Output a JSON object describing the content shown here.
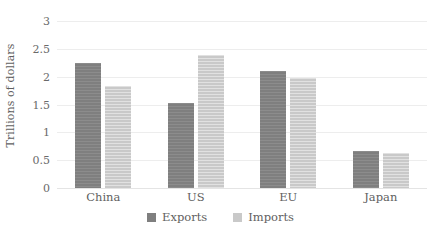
{
  "chart_data": {
    "type": "bar",
    "title": "",
    "subtitle": "",
    "xlabel": "",
    "ylabel": "Trillions of dollars",
    "categories": [
      "China",
      "US",
      "EU",
      "Japan"
    ],
    "series": [
      {
        "name": "Exports",
        "color": "#7f7f7f",
        "values": [
          2.25,
          1.53,
          2.1,
          0.66
        ]
      },
      {
        "name": "Imports",
        "color": "#c9c9c9",
        "values": [
          1.83,
          2.39,
          1.98,
          0.63
        ]
      }
    ],
    "ylim": [
      0,
      3
    ],
    "ytick_values": [
      0,
      0.5,
      1,
      1.5,
      2,
      2.5,
      3
    ],
    "ytick_labels": [
      "0",
      "0.5",
      "1",
      "1.5",
      "2",
      "2.5",
      "3"
    ],
    "grid": true,
    "grid_axis": "y",
    "legend_position": "bottom",
    "legend_entries": [
      "Exports",
      "Imports"
    ],
    "bar_group_mode": "grouped"
  },
  "colors": {
    "exports": "#7f7f7f",
    "imports": "#c9c9c9",
    "gridline": "#ededed",
    "baseline": "#e4e4e4",
    "text": "#5f5f5f",
    "background": "#ffffff"
  }
}
